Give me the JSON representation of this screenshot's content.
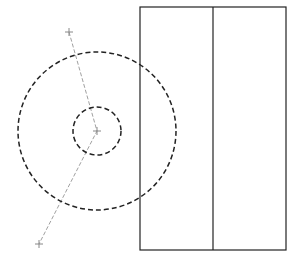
{
  "diagram": {
    "width": 301,
    "height": 264,
    "background": "#ffffff",
    "stroke_color": "#222222",
    "guide_color": "#888888",
    "rectangle": {
      "x": 140,
      "y": 7,
      "width": 146,
      "height": 243
    },
    "divider": {
      "x": 213,
      "y1": 7,
      "y2": 250
    },
    "circles": [
      {
        "name": "outer-dashed-circle",
        "cx": 97,
        "cy": 131,
        "r": 79
      },
      {
        "name": "inner-dashed-circle",
        "cx": 97,
        "cy": 131,
        "r": 24
      }
    ],
    "guide_points": [
      {
        "name": "top-point",
        "x": 69,
        "y": 32
      },
      {
        "name": "center-point",
        "x": 97,
        "y": 131
      },
      {
        "name": "bottom-point",
        "x": 39,
        "y": 244
      }
    ]
  }
}
